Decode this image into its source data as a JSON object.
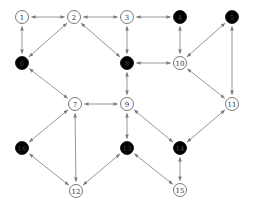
{
  "diagram": {
    "type": "graph",
    "directed": "bidirectional",
    "node_radius": 6.5,
    "colors": {
      "edge": "#8a8a8a",
      "node_open_fill": "#ffffff",
      "node_open_stroke": "#555555",
      "node_filled": "#000000",
      "label_open": "#333333",
      "label_filled": "#444444"
    },
    "nodes": [
      {
        "id": "1",
        "x": 22,
        "y": 17,
        "filled": false
      },
      {
        "id": "2",
        "x": 74,
        "y": 17,
        "filled": false
      },
      {
        "id": "3",
        "x": 127,
        "y": 17,
        "filled": false
      },
      {
        "id": "4",
        "x": 180,
        "y": 17,
        "filled": true
      },
      {
        "id": "5",
        "x": 232,
        "y": 17,
        "filled": true
      },
      {
        "id": "6",
        "x": 22,
        "y": 63,
        "filled": true
      },
      {
        "id": "7",
        "x": 75,
        "y": 104,
        "filled": false
      },
      {
        "id": "8",
        "x": 127,
        "y": 63,
        "filled": true
      },
      {
        "id": "9",
        "x": 127,
        "y": 104,
        "filled": false
      },
      {
        "id": "10",
        "x": 180,
        "y": 63,
        "filled": false
      },
      {
        "id": "11",
        "x": 232,
        "y": 104,
        "filled": false
      },
      {
        "id": "12",
        "x": 76,
        "y": 191,
        "filled": false
      },
      {
        "id": "13",
        "x": 127,
        "y": 148,
        "filled": true
      },
      {
        "id": "14",
        "x": 180,
        "y": 148,
        "filled": true
      },
      {
        "id": "15",
        "x": 180,
        "y": 190,
        "filled": false
      },
      {
        "id": "16",
        "x": 22,
        "y": 148,
        "filled": true
      }
    ],
    "edges": [
      [
        "1",
        "2"
      ],
      [
        "1",
        "6"
      ],
      [
        "2",
        "3"
      ],
      [
        "2",
        "6"
      ],
      [
        "2",
        "8"
      ],
      [
        "3",
        "4"
      ],
      [
        "3",
        "8"
      ],
      [
        "4",
        "10"
      ],
      [
        "5",
        "10"
      ],
      [
        "5",
        "11"
      ],
      [
        "6",
        "7"
      ],
      [
        "7",
        "9"
      ],
      [
        "7",
        "16"
      ],
      [
        "7",
        "12"
      ],
      [
        "8",
        "10"
      ],
      [
        "8",
        "9"
      ],
      [
        "9",
        "13"
      ],
      [
        "9",
        "14"
      ],
      [
        "10",
        "11"
      ],
      [
        "11",
        "14"
      ],
      [
        "12",
        "16"
      ],
      [
        "12",
        "13"
      ],
      [
        "13",
        "15"
      ],
      [
        "14",
        "15"
      ]
    ]
  }
}
